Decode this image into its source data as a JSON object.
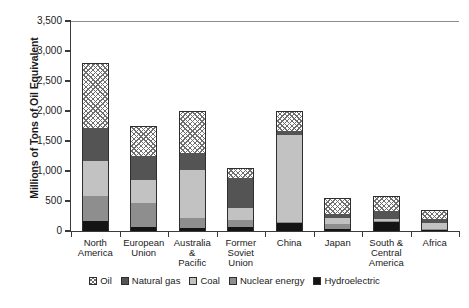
{
  "chart_data": {
    "type": "bar",
    "subtype": "stacked-bar",
    "title": "",
    "xlabel": "",
    "ylabel": "Millions of Tons of Oil Equivalent",
    "ylim": [
      0,
      3500
    ],
    "ytick_values": [
      0,
      500,
      1000,
      1500,
      2000,
      2500,
      3000,
      3500
    ],
    "ytick_labels": [
      "0",
      "500",
      "1,000",
      "1,500",
      "2,000",
      "2,500",
      "3,000",
      "3,500"
    ],
    "grid": false,
    "legend_position": "bottom",
    "stack_order_bottom_to_top": [
      "Hydroelectric",
      "Nuclear energy",
      "Coal",
      "Natural gas",
      "Oil"
    ],
    "categories": [
      "North\nAmerica",
      "European\nUnion",
      "Australia\n&\nPacific",
      "Former\nSoviet\nUnion",
      "China",
      "Japan",
      "South &\nCentral\nAmerica",
      "Africa"
    ],
    "series": [
      {
        "name": "Oil",
        "pattern": "diagonal-crosshatch",
        "color": "#ffffff",
        "values": [
          1080,
          500,
          700,
          170,
          330,
          260,
          250,
          150
        ]
      },
      {
        "name": "Natural gas",
        "pattern": "solid",
        "color": "#545454",
        "values": [
          550,
          400,
          280,
          500,
          70,
          70,
          130,
          70
        ]
      },
      {
        "name": "Coal",
        "pattern": "solid",
        "color": "#c2c2c2",
        "values": [
          580,
          380,
          800,
          200,
          1450,
          110,
          30,
          100
        ]
      },
      {
        "name": "Nuclear energy",
        "pattern": "solid",
        "color": "#8e8e8e",
        "values": [
          420,
          400,
          170,
          120,
          20,
          80,
          10,
          10
        ]
      },
      {
        "name": "Hydroelectric",
        "pattern": "solid",
        "color": "#141414",
        "values": [
          170,
          70,
          50,
          60,
          130,
          30,
          160,
          20
        ]
      }
    ],
    "totals": [
      2800,
      1750,
      2000,
      1050,
      2000,
      550,
      580,
      350
    ]
  },
  "legend": {
    "items": [
      {
        "label": "Oil"
      },
      {
        "label": "Natural gas"
      },
      {
        "label": "Coal"
      },
      {
        "label": "Nuclear energy"
      },
      {
        "label": "Hydroelectric"
      }
    ]
  }
}
